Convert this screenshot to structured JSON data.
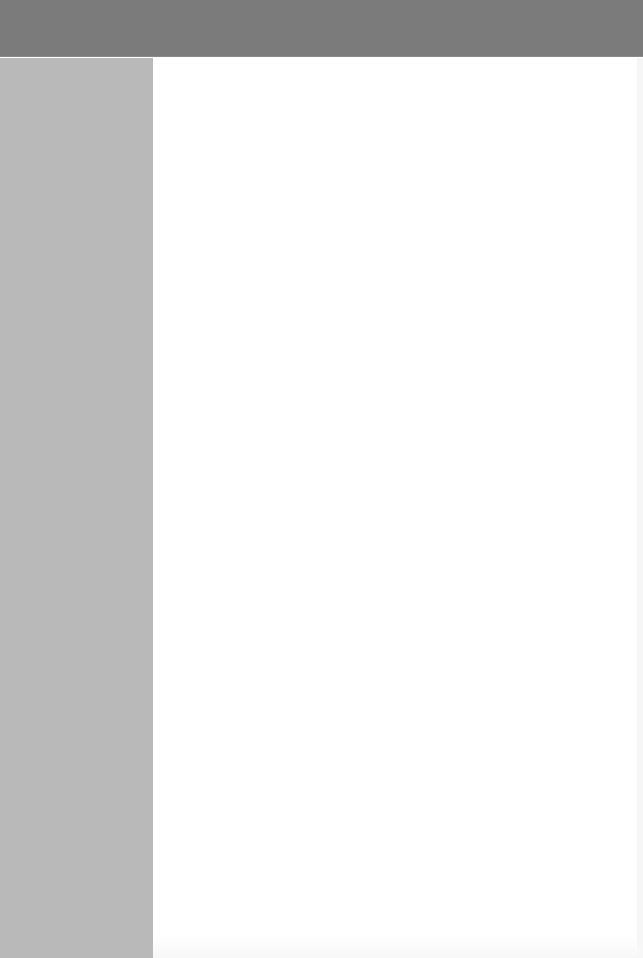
{
  "header": {
    "title": "",
    "background": "#7b7b7b"
  },
  "sidebar": {
    "items": [],
    "background": "#b9b9b9"
  },
  "main": {
    "content": "",
    "background": "#ffffff"
  }
}
